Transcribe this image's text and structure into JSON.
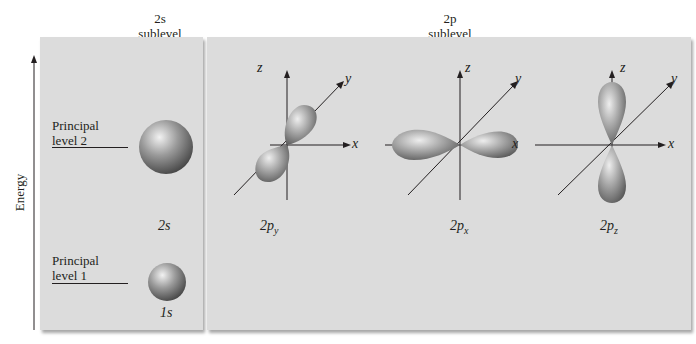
{
  "headers": {
    "s_sublevel": {
      "line1": "2s",
      "line2": "sublevel"
    },
    "p_sublevel": {
      "line1": "2p",
      "line2": "sublevel"
    }
  },
  "axis": {
    "energy_label": "Energy"
  },
  "levels": [
    {
      "line1": "Principal",
      "line2": "level 2"
    },
    {
      "line1": "Principal",
      "line2": "level 1"
    }
  ],
  "orbitals": {
    "two_s": {
      "label": "2s"
    },
    "one_s": {
      "label": "1s"
    },
    "two_py": {
      "main": "2p",
      "sub": "y"
    },
    "two_px": {
      "main": "2p",
      "sub": "x"
    },
    "two_pz": {
      "main": "2p",
      "sub": "z"
    }
  },
  "axes_labels": {
    "x": "x",
    "y": "y",
    "z": "z"
  },
  "colors": {
    "panel": "#dcdcdc",
    "orbital_highlight": "#e0e0e0",
    "orbital_shadow": "#5a5a5a",
    "line": "#231f20"
  }
}
